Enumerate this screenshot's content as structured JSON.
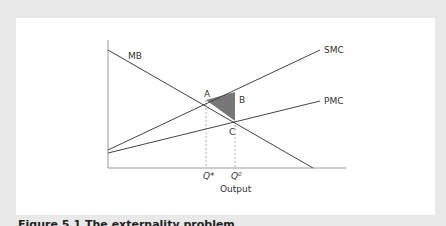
{
  "figure": {
    "caption": "Figure 5.1   The externality problem",
    "xlabel": "Output",
    "curves": [
      {
        "name": "MB",
        "label": "MB"
      },
      {
        "name": "SMC",
        "label": "SMC"
      },
      {
        "name": "PMC",
        "label": "PMC"
      }
    ],
    "points": {
      "A": "A",
      "B": "B",
      "C": "C"
    },
    "ticks": {
      "q_star": "Q*",
      "q_zero": "Q⁰"
    }
  },
  "colors": {
    "background": "#e9e9e9",
    "panel": "#ffffff",
    "line": "#444444",
    "shade": "#777777"
  }
}
